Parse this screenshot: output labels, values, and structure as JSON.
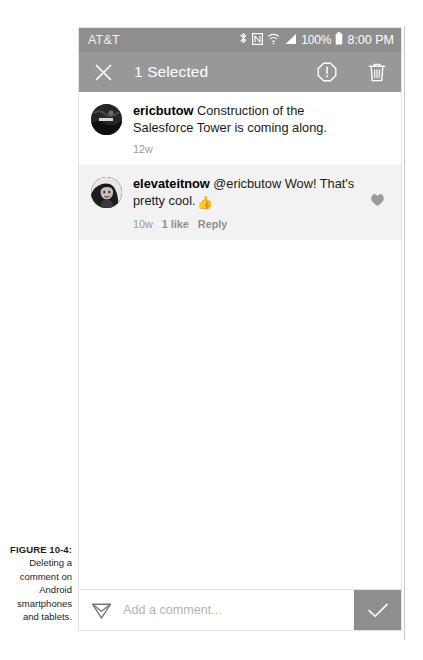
{
  "figure": {
    "label": "FIGURE 10-4:",
    "caption": "Deleting a comment on Android smartphones and tablets."
  },
  "status_bar": {
    "carrier": "AT&T",
    "icons": [
      "bluetooth-icon",
      "nfc-icon",
      "wifi-icon",
      "signal-icon"
    ],
    "battery_percent": "100%",
    "battery_icon": "battery-full-icon",
    "clock": "8:00 PM",
    "background": "#8e8e8e"
  },
  "toolbar": {
    "close_icon": "close-icon",
    "title": "1 Selected",
    "report_icon": "report-alert-icon",
    "delete_icon": "trash-icon",
    "background": "#989898"
  },
  "comments": [
    {
      "avatar": "avatar-ericbutow",
      "username": "ericbutow",
      "text": " Construction of the Salesforce Tower is coming along.",
      "timestamp": "12w",
      "likes": "",
      "reply_label": "",
      "selected": false,
      "liked": false
    },
    {
      "avatar": "avatar-elevateitnow",
      "username": "elevateitnow",
      "text": " @ericbutow Wow! That's pretty cool.",
      "emoji": "👍",
      "timestamp": "10w",
      "likes": "1 like",
      "reply_label": "Reply",
      "selected": true,
      "liked": true
    }
  ],
  "composer": {
    "share_icon": "paper-plane-icon",
    "placeholder": "Add a comment...",
    "value": "",
    "post_icon": "checkmark-icon",
    "post_background": "#8e8e8e"
  },
  "colors": {
    "chrome_gray": "#989898",
    "status_gray": "#8e8e8e",
    "selected_row": "#f2f2f2",
    "meta_gray": "#9a9a9a",
    "text_dark": "#1b1b1b"
  }
}
